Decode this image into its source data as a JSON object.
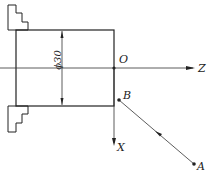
{
  "diagram": {
    "type": "cnc-lathe-coordinate-sketch",
    "workpiece": {
      "diameter_label": "ϕ30"
    },
    "axes": {
      "z_label": "Z",
      "x_label": "X",
      "origin_label": "O"
    },
    "points": [
      {
        "label": "B"
      },
      {
        "label": "A"
      }
    ],
    "path": {
      "from": "A",
      "to": "B"
    },
    "colors": {
      "line": "#222222",
      "background": "#ffffff"
    }
  }
}
